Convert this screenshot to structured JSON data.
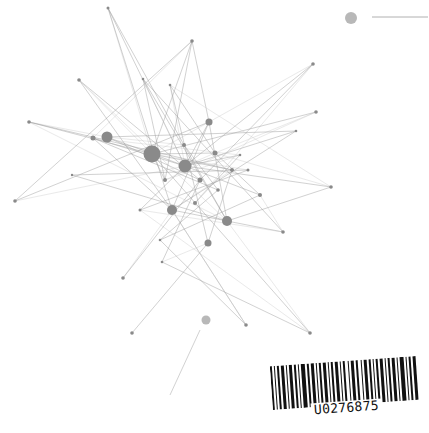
{
  "colors": {
    "node": "#8a8a8a",
    "node_light": "#b8b8b8",
    "edge": "#9a9a9a",
    "barcode": "#111111",
    "background": "#ffffff"
  },
  "legend": {
    "marker_x": 351,
    "marker_y": 18,
    "marker_r": 6,
    "line_x1": 372,
    "line_x2": 428,
    "line_y": 17
  },
  "nodes": [
    {
      "id": 0,
      "x": 108,
      "y": 8,
      "r": 1.5
    },
    {
      "id": 1,
      "x": 192,
      "y": 41,
      "r": 1.8
    },
    {
      "id": 2,
      "x": 79,
      "y": 80,
      "r": 1.8
    },
    {
      "id": 3,
      "x": 143,
      "y": 79,
      "r": 1.3
    },
    {
      "id": 4,
      "x": 170,
      "y": 85,
      "r": 1.3
    },
    {
      "id": 5,
      "x": 29,
      "y": 122,
      "r": 1.8
    },
    {
      "id": 6,
      "x": 93,
      "y": 138,
      "r": 2.5
    },
    {
      "id": 7,
      "x": 107,
      "y": 137,
      "r": 5.5
    },
    {
      "id": 8,
      "x": 152,
      "y": 154,
      "r": 8.5
    },
    {
      "id": 9,
      "x": 185,
      "y": 166,
      "r": 6.5
    },
    {
      "id": 10,
      "x": 209,
      "y": 122,
      "r": 3.5
    },
    {
      "id": 11,
      "x": 215,
      "y": 153,
      "r": 2.5
    },
    {
      "id": 12,
      "x": 313,
      "y": 64,
      "r": 1.8
    },
    {
      "id": 13,
      "x": 316,
      "y": 112,
      "r": 1.8
    },
    {
      "id": 14,
      "x": 296,
      "y": 131,
      "r": 1.3
    },
    {
      "id": 15,
      "x": 232,
      "y": 170,
      "r": 2
    },
    {
      "id": 16,
      "x": 248,
      "y": 170,
      "r": 1.5
    },
    {
      "id": 17,
      "x": 260,
      "y": 195,
      "r": 2
    },
    {
      "id": 18,
      "x": 331,
      "y": 187,
      "r": 1.8
    },
    {
      "id": 19,
      "x": 172,
      "y": 210,
      "r": 5
    },
    {
      "id": 20,
      "x": 227,
      "y": 221,
      "r": 5
    },
    {
      "id": 21,
      "x": 208,
      "y": 243,
      "r": 3.5
    },
    {
      "id": 22,
      "x": 15,
      "y": 201,
      "r": 1.8
    },
    {
      "id": 23,
      "x": 72,
      "y": 175,
      "r": 1.2
    },
    {
      "id": 24,
      "x": 283,
      "y": 232,
      "r": 1.8
    },
    {
      "id": 25,
      "x": 123,
      "y": 278,
      "r": 1.8
    },
    {
      "id": 26,
      "x": 162,
      "y": 262,
      "r": 1.3
    },
    {
      "id": 27,
      "x": 246,
      "y": 325,
      "r": 1.8
    },
    {
      "id": 28,
      "x": 132,
      "y": 333,
      "r": 1.8
    },
    {
      "id": 29,
      "x": 310,
      "y": 333,
      "r": 1.8
    },
    {
      "id": 30,
      "x": 206,
      "y": 320,
      "r": 4.5,
      "light": true
    },
    {
      "id": 31,
      "x": 184,
      "y": 145,
      "r": 2
    },
    {
      "id": 32,
      "x": 195,
      "y": 203,
      "r": 2
    },
    {
      "id": 33,
      "x": 165,
      "y": 180,
      "r": 2
    },
    {
      "id": 34,
      "x": 218,
      "y": 190,
      "r": 1.8
    },
    {
      "id": 35,
      "x": 140,
      "y": 210,
      "r": 1.5
    },
    {
      "id": 36,
      "x": 240,
      "y": 155,
      "r": 1.3
    },
    {
      "id": 37,
      "x": 200,
      "y": 180,
      "r": 2.5
    },
    {
      "id": 38,
      "x": 160,
      "y": 240,
      "r": 1.3
    }
  ],
  "edges": [
    [
      0,
      8
    ],
    [
      0,
      9
    ],
    [
      0,
      31
    ],
    [
      1,
      6
    ],
    [
      1,
      10
    ],
    [
      1,
      8
    ],
    [
      2,
      8
    ],
    [
      2,
      19
    ],
    [
      2,
      37
    ],
    [
      3,
      9
    ],
    [
      3,
      33
    ],
    [
      3,
      20
    ],
    [
      4,
      9
    ],
    [
      4,
      21
    ],
    [
      4,
      11
    ],
    [
      5,
      7
    ],
    [
      5,
      8
    ],
    [
      5,
      15
    ],
    [
      5,
      20
    ],
    [
      6,
      9
    ],
    [
      6,
      19
    ],
    [
      7,
      31
    ],
    [
      7,
      9
    ],
    [
      7,
      37
    ],
    [
      8,
      10
    ],
    [
      8,
      11
    ],
    [
      8,
      15
    ],
    [
      8,
      16
    ],
    [
      8,
      33
    ],
    [
      9,
      10
    ],
    [
      9,
      11
    ],
    [
      9,
      14
    ],
    [
      9,
      36
    ],
    [
      10,
      12
    ],
    [
      10,
      19
    ],
    [
      10,
      20
    ],
    [
      11,
      13
    ],
    [
      11,
      17
    ],
    [
      12,
      37
    ],
    [
      12,
      32
    ],
    [
      12,
      9
    ],
    [
      13,
      8
    ],
    [
      13,
      33
    ],
    [
      14,
      7
    ],
    [
      14,
      19
    ],
    [
      15,
      19
    ],
    [
      15,
      21
    ],
    [
      16,
      35
    ],
    [
      17,
      24
    ],
    [
      17,
      9
    ],
    [
      18,
      20
    ],
    [
      18,
      11
    ],
    [
      18,
      9
    ],
    [
      19,
      20
    ],
    [
      19,
      25
    ],
    [
      19,
      27
    ],
    [
      20,
      24
    ],
    [
      20,
      29
    ],
    [
      20,
      31
    ],
    [
      21,
      28
    ],
    [
      21,
      26
    ],
    [
      22,
      10
    ],
    [
      22,
      1
    ],
    [
      22,
      9
    ],
    [
      23,
      16
    ],
    [
      23,
      20
    ],
    [
      24,
      35
    ],
    [
      25,
      37
    ],
    [
      26,
      29
    ],
    [
      27,
      19
    ],
    [
      27,
      38
    ],
    [
      29,
      8
    ],
    [
      29,
      35
    ],
    [
      31,
      34
    ],
    [
      32,
      36
    ],
    [
      33,
      36
    ],
    [
      34,
      38
    ],
    [
      35,
      9
    ],
    [
      36,
      6
    ],
    [
      37,
      26
    ],
    [
      38,
      17
    ],
    [
      2,
      20
    ],
    [
      3,
      24
    ],
    [
      6,
      34
    ],
    [
      4,
      18
    ],
    [
      0,
      19
    ],
    [
      1,
      33
    ]
  ],
  "stray_line": {
    "x1": 200,
    "y1": 330,
    "x2": 170,
    "y2": 395
  },
  "barcode": {
    "label": "U0276875",
    "bars": [
      [
        0,
        2
      ],
      [
        4,
        1
      ],
      [
        7,
        2
      ],
      [
        11,
        3
      ],
      [
        16,
        1
      ],
      [
        19,
        3
      ],
      [
        24,
        2
      ],
      [
        28,
        1
      ],
      [
        31,
        4
      ],
      [
        37,
        2
      ],
      [
        41,
        3
      ],
      [
        46,
        1
      ],
      [
        49,
        2
      ],
      [
        53,
        3
      ],
      [
        58,
        1
      ],
      [
        61,
        2
      ],
      [
        65,
        3
      ],
      [
        70,
        1
      ],
      [
        73,
        2
      ],
      [
        78,
        1
      ],
      [
        81,
        3
      ],
      [
        86,
        2
      ],
      [
        91,
        1
      ],
      [
        94,
        3
      ],
      [
        99,
        2
      ],
      [
        103,
        1
      ],
      [
        106,
        2
      ],
      [
        110,
        3
      ],
      [
        115,
        1
      ],
      [
        118,
        2
      ],
      [
        122,
        3
      ],
      [
        127,
        1
      ],
      [
        130,
        4
      ],
      [
        136,
        1
      ],
      [
        139,
        2
      ],
      [
        143,
        3
      ]
    ]
  }
}
